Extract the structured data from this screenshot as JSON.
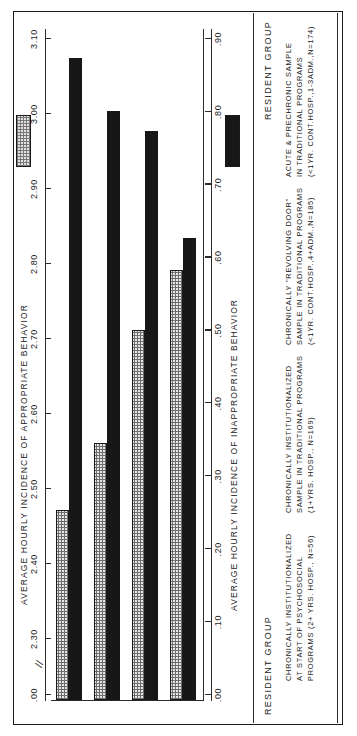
{
  "figure": {
    "orientation": "rotated-90",
    "background": "#ffffff",
    "frame_color": "#1a1a1a"
  },
  "headers": {
    "resident_group_left": "RESIDENT GROUP",
    "resident_group_right": "RESIDENT GROUP"
  },
  "legend": {
    "appropriate_swatch": "dotted-hatch-swatch",
    "inappropriate_swatch": "solid-black-swatch",
    "appropriate_color": "#e6e6e6",
    "inappropriate_color": "#171717"
  },
  "chart_data": {
    "type": "bar",
    "title": "",
    "orientation": "horizontal",
    "grid": false,
    "legend_position": "right-of-axis-title",
    "categories": [
      "CHRONICALLY INSTITUTIONALIZED AT START OF PSYCHOSOCIAL PROGRAMS (2+ YRS. HOSP., N=56)",
      "CHRONICALLY INSTITUTIONALIZED SAMPLE IN TRADITIONAL PROGRAMS (1+YRS. HOSP., N=169)",
      "CHRONICALLY \"REVOLVING DOOR\" SAMPLE IN TRADITIONAL PROGRAMS (<1YR. CONT.HOSP.,4+ADM.,N=185)",
      "ACUTE & PRECHRONIC SAMPLE IN TRADITIONAL PROGRAMS (<1YR. CONT.HOSP.,1-3ADM.,N=174)"
    ],
    "category_lines": [
      [
        "CHRONICALLY INSTITUTIONALIZED",
        "AT START OF PSYCHOSOCIAL",
        "PROGRAMS (2+ YRS. HOSP., N=56)"
      ],
      [
        "CHRONICALLY INSTITUTIONALIZED",
        "SAMPLE IN TRADITIONAL PROGRAMS",
        "(1+YRS. HOSP., N=169)"
      ],
      [
        "CHRONICALLY \"REVOLVING DOOR\"",
        "SAMPLE IN TRADITIONAL PROGRAMS",
        "(<1YR. CONT.HOSP.,4+ADM.,N=185)"
      ],
      [
        "ACUTE & PRECHRONIC SAMPLE",
        "IN TRADITIONAL PROGRAMS",
        "(<1YR. CONT.HOSP.,1-3ADM.,N=174)"
      ]
    ],
    "series": [
      {
        "name": "AVERAGE HOURLY INCIDENCE OF APPROPRIATE BEHAVIOR",
        "axis": "top",
        "pattern": "dotted",
        "values": [
          2.47,
          2.56,
          2.71,
          2.79
        ]
      },
      {
        "name": "AVERAGE HOURLY INCIDENCE OF INAPPROPRIATE BEHAVIOR",
        "axis": "bottom",
        "pattern": "solid",
        "values": [
          0.87,
          0.79,
          0.76,
          0.6
        ]
      }
    ],
    "axes": {
      "top": {
        "title": "AVERAGE HOURLY INCIDENCE OF APPROPRIATE BEHAVIOR",
        "ticks": [
          ".00",
          "2.30",
          "2.40",
          "2.50",
          "2.60",
          "2.70",
          "2.80",
          "2.90",
          "3.00",
          "3.10"
        ],
        "tick_values": [
          0.0,
          2.3,
          2.4,
          2.5,
          2.6,
          2.7,
          2.8,
          2.9,
          3.0,
          3.1
        ],
        "axis_break": true,
        "break_symbol": "//",
        "range_start": 2.25,
        "range_end": 3.1
      },
      "bottom": {
        "title": "AVERAGE HOURLY INCIDENCE OF INAPPROPRIATE BEHAVIOR",
        "ticks": [
          ".00",
          ".10",
          ".20",
          ".30",
          ".40",
          ".50",
          ".60",
          ".70",
          ".80",
          ".90"
        ],
        "tick_values": [
          0.0,
          0.1,
          0.2,
          0.3,
          0.4,
          0.5,
          0.6,
          0.7,
          0.8,
          0.9
        ],
        "axis_break": false,
        "range_start": 0.0,
        "range_end": 0.9
      }
    }
  }
}
